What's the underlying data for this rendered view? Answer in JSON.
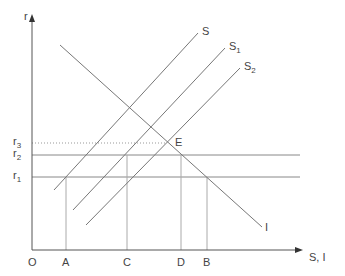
{
  "diagram": {
    "axes": {
      "y_label": "r",
      "x_label": "S, I",
      "origin_label": "O"
    },
    "interest_rates": [
      {
        "main": "r",
        "sub": "3",
        "y": 143,
        "style": "dotted"
      },
      {
        "main": "r",
        "sub": "2",
        "y": 155,
        "style": "solid"
      },
      {
        "main": "r",
        "sub": "1",
        "y": 177,
        "style": "solid"
      }
    ],
    "x_points": [
      {
        "label": "A",
        "x": 66,
        "from_y": 177
      },
      {
        "label": "C",
        "x": 127,
        "from_y": 155
      },
      {
        "label": "D",
        "x": 181,
        "from_y": 155
      },
      {
        "label": "B",
        "x": 207,
        "from_y": 177
      }
    ],
    "curves": [
      {
        "id": "S",
        "main": "S",
        "sub": "",
        "x1": 54,
        "y1": 190,
        "x2": 198,
        "y2": 33
      },
      {
        "id": "S1",
        "main": "S",
        "sub": "1",
        "x1": 73,
        "y1": 210,
        "x2": 225,
        "y2": 48
      },
      {
        "id": "S2",
        "main": "S",
        "sub": "2",
        "x1": 86,
        "y1": 225,
        "x2": 240,
        "y2": 68
      },
      {
        "id": "I",
        "main": "I",
        "sub": "",
        "x1": 60,
        "y1": 45,
        "x2": 262,
        "y2": 227
      }
    ],
    "equilibrium": {
      "label": "E",
      "x": 166,
      "y": 143
    }
  }
}
